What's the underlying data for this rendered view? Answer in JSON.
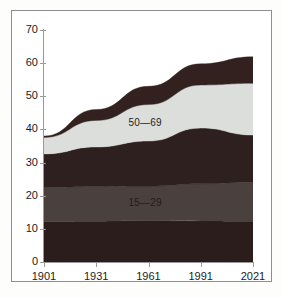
{
  "chart_data": {
    "type": "area",
    "stacked": true,
    "title": "",
    "subtitle": "",
    "xlabel": "",
    "ylabel": "",
    "x": [
      1901,
      1931,
      1961,
      1991,
      2021
    ],
    "xtick_labels": [
      "1901",
      "1931",
      "1961",
      "1991",
      "2021"
    ],
    "ytick_labels": [
      "0",
      "10",
      "20",
      "30",
      "40",
      "50",
      "60",
      "70"
    ],
    "ytick_values": [
      0,
      10,
      20,
      30,
      40,
      50,
      60,
      70
    ],
    "ylim": [
      0,
      70
    ],
    "xlim": [
      1901,
      2021
    ],
    "grid": false,
    "legend_position": "none",
    "series": [
      {
        "name": "0—14",
        "label": "",
        "color": "#2a1d1c",
        "values": [
          12.2,
          12.3,
          12.5,
          12.4,
          12.3
        ]
      },
      {
        "name": "15—29",
        "label": "15—29",
        "color": "#4a403d",
        "values": [
          10.3,
          10.5,
          10.4,
          11.2,
          11.8
        ]
      },
      {
        "name": "30—49",
        "label": "",
        "color": "#2d201e",
        "values": [
          10.1,
          11.9,
          13.6,
          16.8,
          14.2
        ]
      },
      {
        "name": "50—69",
        "label": "50—69",
        "color": "#dcdedb",
        "values": [
          5.0,
          8.0,
          11.0,
          13.0,
          15.6
        ]
      },
      {
        "name": "70+",
        "label": "",
        "color": "#32211f",
        "values": [
          0.4,
          3.3,
          5.5,
          6.4,
          8.0
        ]
      }
    ],
    "totals": [
      38.0,
      46.0,
      53.0,
      59.8,
      61.9
    ],
    "annotations": [
      {
        "text": "50—69",
        "series": "50—69",
        "x": 1961
      },
      {
        "text": "15—29",
        "series": "15—29",
        "x": 1961
      }
    ],
    "colors": {
      "axis": "#9a9a9a",
      "text": "#1b1b1b",
      "background": "#ffffff",
      "frame": "#8e8e8e"
    }
  },
  "axis": {
    "y_ticks": [
      "70",
      "60",
      "50",
      "40",
      "30",
      "20",
      "10",
      "0"
    ],
    "x_ticks": [
      "1901",
      "1931",
      "1961",
      "1991",
      "2021"
    ]
  },
  "labels": {
    "band_upper": "50—69",
    "band_lower": "15—29"
  }
}
